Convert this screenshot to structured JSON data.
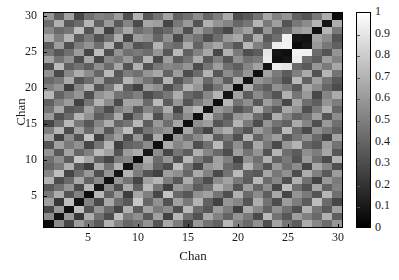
{
  "figure": {
    "background_color": "#ffffff",
    "text_color": "#1a1a1a"
  },
  "chart_data": {
    "type": "heatmap",
    "title": "",
    "xlabel": "Chan",
    "ylabel": "Chan",
    "xlim": [
      0.5,
      30.5
    ],
    "ylim": [
      0.5,
      30.5
    ],
    "xticks": [
      5,
      10,
      15,
      20,
      25,
      30
    ],
    "yticks": [
      5,
      10,
      15,
      20,
      25,
      30
    ],
    "xticklabels": [
      "5",
      "10",
      "15",
      "20",
      "25",
      "30"
    ],
    "yticklabels": [
      "5",
      "10",
      "15",
      "20",
      "25",
      "30"
    ],
    "grid": false,
    "origin": "lower",
    "colormap": "gray",
    "colorbar": {
      "position": "right",
      "vmin": 0,
      "vmax": 1,
      "ticks": [
        0,
        0.1,
        0.2,
        0.3,
        0.4,
        0.5,
        0.6,
        0.7,
        0.8,
        0.9,
        1
      ],
      "ticklabels": [
        "0",
        "0.1",
        "0.2",
        "0.3",
        "0.4",
        "0.5",
        "0.6",
        "0.7",
        "0.8",
        "0.9",
        "1"
      ],
      "low_color": "#000000",
      "high_color": "#ffffff"
    },
    "n_rows": 30,
    "n_cols": 30,
    "x": [
      1,
      2,
      3,
      4,
      5,
      6,
      7,
      8,
      9,
      10,
      11,
      12,
      13,
      14,
      15,
      16,
      17,
      18,
      19,
      20,
      21,
      22,
      23,
      24,
      25,
      26,
      27,
      28,
      29,
      30
    ],
    "y": [
      1,
      2,
      3,
      4,
      5,
      6,
      7,
      8,
      9,
      10,
      11,
      12,
      13,
      14,
      15,
      16,
      17,
      18,
      19,
      20,
      21,
      22,
      23,
      24,
      25,
      26,
      27,
      28,
      29,
      30
    ],
    "values": [
      [
        0.05,
        0.55,
        0.28,
        0.62,
        0.47,
        0.35,
        0.7,
        0.52,
        0.4,
        0.44,
        0.58,
        0.33,
        0.66,
        0.49,
        0.27,
        0.6,
        0.45,
        0.38,
        0.72,
        0.5,
        0.41,
        0.57,
        0.31,
        0.64,
        0.46,
        0.36,
        0.68,
        0.53,
        0.42,
        0.59
      ],
      [
        0.55,
        0.08,
        0.6,
        0.22,
        0.68,
        0.44,
        0.3,
        0.75,
        0.48,
        0.56,
        0.35,
        0.63,
        0.26,
        0.71,
        0.43,
        0.32,
        0.66,
        0.51,
        0.39,
        0.58,
        0.47,
        0.29,
        0.73,
        0.45,
        0.34,
        0.62,
        0.5,
        0.41,
        0.69,
        0.37
      ],
      [
        0.28,
        0.6,
        0.06,
        0.74,
        0.33,
        0.58,
        0.41,
        0.27,
        0.69,
        0.36,
        0.64,
        0.48,
        0.55,
        0.3,
        0.72,
        0.42,
        0.34,
        0.61,
        0.49,
        0.25,
        0.67,
        0.53,
        0.38,
        0.57,
        0.44,
        0.31,
        0.7,
        0.46,
        0.35,
        0.63
      ],
      [
        0.62,
        0.22,
        0.74,
        0.07,
        0.51,
        0.29,
        0.66,
        0.43,
        0.35,
        0.78,
        0.4,
        0.57,
        0.32,
        0.63,
        0.47,
        0.7,
        0.38,
        0.26,
        0.59,
        0.52,
        0.33,
        0.68,
        0.45,
        0.3,
        0.61,
        0.49,
        0.36,
        0.74,
        0.42,
        0.28
      ],
      [
        0.47,
        0.68,
        0.33,
        0.51,
        0.05,
        0.72,
        0.39,
        0.6,
        0.24,
        0.65,
        0.5,
        0.28,
        0.76,
        0.41,
        0.34,
        0.57,
        0.63,
        0.46,
        0.31,
        0.69,
        0.42,
        0.55,
        0.37,
        0.66,
        0.27,
        0.58,
        0.48,
        0.33,
        0.71,
        0.44
      ],
      [
        0.35,
        0.44,
        0.58,
        0.29,
        0.72,
        0.09,
        0.54,
        0.31,
        0.67,
        0.38,
        0.73,
        0.46,
        0.25,
        0.6,
        0.52,
        0.36,
        0.44,
        0.7,
        0.57,
        0.33,
        0.62,
        0.4,
        0.56,
        0.28,
        0.74,
        0.43,
        0.32,
        0.65,
        0.38,
        0.51
      ],
      [
        0.7,
        0.3,
        0.41,
        0.66,
        0.39,
        0.54,
        0.06,
        0.58,
        0.45,
        0.27,
        0.63,
        0.71,
        0.49,
        0.34,
        0.68,
        0.43,
        0.3,
        0.55,
        0.64,
        0.47,
        0.36,
        0.72,
        0.42,
        0.53,
        0.31,
        0.69,
        0.44,
        0.26,
        0.6,
        0.48
      ],
      [
        0.52,
        0.75,
        0.27,
        0.43,
        0.6,
        0.31,
        0.58,
        0.08,
        0.7,
        0.49,
        0.33,
        0.25,
        0.62,
        0.56,
        0.4,
        0.67,
        0.51,
        0.29,
        0.45,
        0.73,
        0.38,
        0.34,
        0.65,
        0.47,
        0.57,
        0.3,
        0.68,
        0.5,
        0.35,
        0.61
      ],
      [
        0.4,
        0.48,
        0.69,
        0.35,
        0.24,
        0.67,
        0.45,
        0.7,
        0.07,
        0.53,
        0.61,
        0.39,
        0.3,
        0.74,
        0.46,
        0.28,
        0.58,
        0.64,
        0.42,
        0.36,
        0.71,
        0.49,
        0.33,
        0.6,
        0.44,
        0.55,
        0.27,
        0.66,
        0.52,
        0.31
      ],
      [
        0.44,
        0.56,
        0.36,
        0.78,
        0.65,
        0.38,
        0.27,
        0.49,
        0.53,
        0.05,
        0.68,
        0.42,
        0.59,
        0.31,
        0.72,
        0.47,
        0.35,
        0.63,
        0.5,
        0.26,
        0.57,
        0.44,
        0.69,
        0.39,
        0.48,
        0.33,
        0.61,
        0.43,
        0.29,
        0.7
      ],
      [
        0.58,
        0.35,
        0.64,
        0.4,
        0.5,
        0.73,
        0.63,
        0.33,
        0.61,
        0.68,
        0.09,
        0.55,
        0.28,
        0.46,
        0.37,
        0.69,
        0.52,
        0.41,
        0.3,
        0.62,
        0.45,
        0.58,
        0.32,
        0.71,
        0.43,
        0.36,
        0.56,
        0.49,
        0.65,
        0.34
      ],
      [
        0.33,
        0.63,
        0.48,
        0.57,
        0.28,
        0.46,
        0.71,
        0.25,
        0.39,
        0.42,
        0.55,
        0.06,
        0.67,
        0.52,
        0.6,
        0.31,
        0.44,
        0.73,
        0.38,
        0.56,
        0.34,
        0.66,
        0.47,
        0.29,
        0.59,
        0.7,
        0.4,
        0.35,
        0.62,
        0.45
      ],
      [
        0.66,
        0.26,
        0.55,
        0.32,
        0.76,
        0.25,
        0.49,
        0.62,
        0.3,
        0.59,
        0.28,
        0.67,
        0.07,
        0.58,
        0.43,
        0.54,
        0.68,
        0.36,
        0.47,
        0.31,
        0.7,
        0.39,
        0.53,
        0.62,
        0.34,
        0.46,
        0.57,
        0.41,
        0.27,
        0.64
      ],
      [
        0.49,
        0.71,
        0.3,
        0.63,
        0.41,
        0.6,
        0.34,
        0.56,
        0.74,
        0.31,
        0.46,
        0.52,
        0.58,
        0.08,
        0.65,
        0.4,
        0.27,
        0.59,
        0.68,
        0.44,
        0.33,
        0.61,
        0.5,
        0.36,
        0.72,
        0.42,
        0.29,
        0.57,
        0.47,
        0.38
      ],
      [
        0.27,
        0.43,
        0.72,
        0.47,
        0.34,
        0.52,
        0.68,
        0.4,
        0.46,
        0.72,
        0.37,
        0.6,
        0.43,
        0.65,
        0.05,
        0.56,
        0.62,
        0.33,
        0.41,
        0.7,
        0.48,
        0.3,
        0.58,
        0.45,
        0.38,
        0.67,
        0.52,
        0.31,
        0.6,
        0.44
      ],
      [
        0.6,
        0.32,
        0.42,
        0.7,
        0.57,
        0.36,
        0.43,
        0.67,
        0.28,
        0.47,
        0.69,
        0.31,
        0.54,
        0.4,
        0.56,
        0.06,
        0.72,
        0.48,
        0.35,
        0.59,
        0.64,
        0.42,
        0.3,
        0.68,
        0.51,
        0.39,
        0.45,
        0.62,
        0.33,
        0.55
      ],
      [
        0.45,
        0.66,
        0.34,
        0.38,
        0.63,
        0.44,
        0.3,
        0.51,
        0.58,
        0.35,
        0.52,
        0.44,
        0.68,
        0.27,
        0.62,
        0.72,
        0.07,
        0.6,
        0.53,
        0.32,
        0.41,
        0.7,
        0.46,
        0.35,
        0.66,
        0.57,
        0.31,
        0.48,
        0.69,
        0.4
      ],
      [
        0.38,
        0.51,
        0.61,
        0.26,
        0.46,
        0.7,
        0.55,
        0.29,
        0.64,
        0.63,
        0.41,
        0.73,
        0.36,
        0.59,
        0.33,
        0.48,
        0.6,
        0.06,
        0.71,
        0.45,
        0.56,
        0.34,
        0.62,
        0.5,
        0.28,
        0.65,
        0.43,
        0.37,
        0.58,
        0.49
      ],
      [
        0.72,
        0.39,
        0.49,
        0.59,
        0.31,
        0.57,
        0.64,
        0.45,
        0.42,
        0.5,
        0.3,
        0.38,
        0.47,
        0.68,
        0.41,
        0.35,
        0.53,
        0.71,
        0.08,
        0.63,
        0.36,
        0.55,
        0.44,
        0.33,
        0.69,
        0.46,
        0.6,
        0.28,
        0.52,
        0.67
      ],
      [
        0.5,
        0.58,
        0.25,
        0.52,
        0.69,
        0.33,
        0.47,
        0.73,
        0.36,
        0.26,
        0.62,
        0.56,
        0.31,
        0.44,
        0.7,
        0.59,
        0.32,
        0.45,
        0.63,
        0.05,
        0.68,
        0.43,
        0.37,
        0.57,
        0.48,
        0.34,
        0.66,
        0.54,
        0.4,
        0.3
      ],
      [
        0.41,
        0.47,
        0.67,
        0.33,
        0.42,
        0.62,
        0.36,
        0.38,
        0.71,
        0.57,
        0.45,
        0.34,
        0.7,
        0.33,
        0.48,
        0.64,
        0.41,
        0.56,
        0.36,
        0.68,
        0.07,
        0.59,
        0.52,
        0.44,
        0.31,
        0.72,
        0.38,
        0.63,
        0.46,
        0.35
      ],
      [
        0.57,
        0.29,
        0.53,
        0.68,
        0.55,
        0.4,
        0.72,
        0.34,
        0.49,
        0.44,
        0.58,
        0.66,
        0.39,
        0.61,
        0.3,
        0.42,
        0.7,
        0.34,
        0.55,
        0.43,
        0.59,
        0.06,
        0.64,
        0.48,
        0.36,
        0.5,
        0.67,
        0.32,
        0.71,
        0.45
      ],
      [
        0.31,
        0.73,
        0.38,
        0.45,
        0.37,
        0.56,
        0.42,
        0.65,
        0.33,
        0.69,
        0.32,
        0.47,
        0.53,
        0.5,
        0.58,
        0.3,
        0.46,
        0.62,
        0.44,
        0.37,
        0.52,
        0.64,
        0.08,
        0.92,
        0.9,
        0.41,
        0.35,
        0.59,
        0.48,
        0.66
      ],
      [
        0.64,
        0.45,
        0.57,
        0.3,
        0.66,
        0.28,
        0.53,
        0.47,
        0.6,
        0.39,
        0.71,
        0.29,
        0.62,
        0.36,
        0.45,
        0.68,
        0.35,
        0.5,
        0.33,
        0.57,
        0.44,
        0.48,
        0.92,
        0.05,
        0.08,
        0.93,
        0.43,
        0.37,
        0.62,
        0.51
      ],
      [
        0.46,
        0.34,
        0.44,
        0.61,
        0.27,
        0.74,
        0.31,
        0.57,
        0.44,
        0.48,
        0.43,
        0.59,
        0.34,
        0.72,
        0.38,
        0.51,
        0.66,
        0.28,
        0.69,
        0.48,
        0.31,
        0.36,
        0.9,
        0.08,
        0.06,
        0.95,
        0.94,
        0.42,
        0.33,
        0.58
      ],
      [
        0.36,
        0.62,
        0.31,
        0.49,
        0.58,
        0.43,
        0.69,
        0.3,
        0.55,
        0.33,
        0.36,
        0.7,
        0.46,
        0.42,
        0.67,
        0.39,
        0.57,
        0.65,
        0.46,
        0.34,
        0.72,
        0.5,
        0.41,
        0.93,
        0.95,
        0.05,
        0.09,
        0.6,
        0.47,
        0.38
      ],
      [
        0.68,
        0.5,
        0.7,
        0.36,
        0.48,
        0.32,
        0.44,
        0.68,
        0.27,
        0.61,
        0.56,
        0.4,
        0.57,
        0.29,
        0.52,
        0.45,
        0.31,
        0.43,
        0.6,
        0.66,
        0.38,
        0.67,
        0.35,
        0.43,
        0.94,
        0.09,
        0.07,
        0.64,
        0.55,
        0.33
      ],
      [
        0.53,
        0.41,
        0.46,
        0.74,
        0.33,
        0.65,
        0.26,
        0.5,
        0.66,
        0.43,
        0.49,
        0.35,
        0.41,
        0.57,
        0.31,
        0.62,
        0.48,
        0.37,
        0.28,
        0.54,
        0.63,
        0.32,
        0.59,
        0.37,
        0.42,
        0.6,
        0.64,
        0.06,
        0.71,
        0.47
      ],
      [
        0.42,
        0.69,
        0.35,
        0.42,
        0.71,
        0.38,
        0.6,
        0.35,
        0.52,
        0.29,
        0.65,
        0.62,
        0.27,
        0.47,
        0.6,
        0.33,
        0.69,
        0.58,
        0.52,
        0.4,
        0.46,
        0.71,
        0.48,
        0.62,
        0.33,
        0.47,
        0.55,
        0.71,
        0.08,
        0.68
      ],
      [
        0.59,
        0.37,
        0.63,
        0.28,
        0.44,
        0.51,
        0.48,
        0.61,
        0.31,
        0.7,
        0.34,
        0.45,
        0.64,
        0.38,
        0.44,
        0.55,
        0.4,
        0.49,
        0.67,
        0.3,
        0.35,
        0.45,
        0.66,
        0.51,
        0.58,
        0.38,
        0.33,
        0.47,
        0.68,
        0.05
      ]
    ]
  }
}
